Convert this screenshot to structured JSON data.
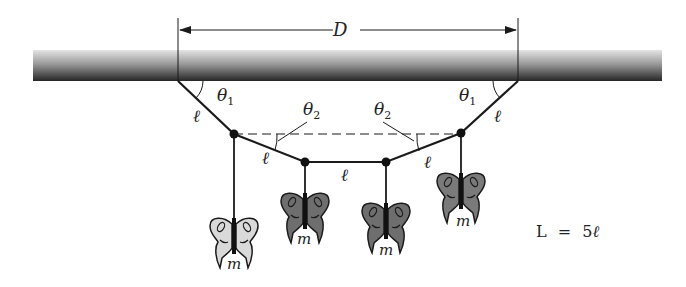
{
  "figure": {
    "dimension_label": "D",
    "angle_labels": {
      "theta1_left": "θ",
      "theta1_left_sub": "1",
      "theta1_right": "θ",
      "theta1_right_sub": "1",
      "theta2_left": "θ",
      "theta2_left_sub": "2",
      "theta2_right": "θ",
      "theta2_right_sub": "2"
    },
    "segment_label": "ℓ",
    "mass_label": "m",
    "equation": {
      "lhs": "L",
      "op": "=",
      "rhs_coef": "5",
      "rhs_var": "ℓ"
    },
    "colors": {
      "line": "#1a1a1a",
      "ceiling_top": "#d8d8d8",
      "ceiling_bottom": "#2a2a2a",
      "butterfly_light": "#d9d9d9",
      "butterfly_dark": "#6e6e6e"
    },
    "nodes": [
      {
        "x": 178,
        "y": 81
      },
      {
        "x": 234,
        "y": 134
      },
      {
        "x": 305,
        "y": 162
      },
      {
        "x": 386,
        "y": 162
      },
      {
        "x": 461,
        "y": 133
      },
      {
        "x": 518,
        "y": 81
      }
    ],
    "masses": [
      {
        "x": 234,
        "top": 215,
        "shade": "light"
      },
      {
        "x": 305,
        "top": 190,
        "shade": "dark"
      },
      {
        "x": 386,
        "top": 200,
        "shade": "dark"
      },
      {
        "x": 461,
        "top": 170,
        "shade": "dark"
      }
    ]
  }
}
